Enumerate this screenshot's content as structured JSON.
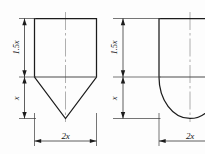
{
  "diagram": {
    "background_color": "#fdfdfd",
    "line_color": "#1c1c1c",
    "centerline_color": "#9a9a9a",
    "figures": [
      {
        "id": "conical-bottom-tank",
        "name": "Tank with conical bottom",
        "bottom_type": "cone",
        "dimensions": {
          "body_height": "1.5x",
          "bottom_height": "x",
          "width": "2x"
        }
      },
      {
        "id": "hemispherical-bottom-tank",
        "name": "Tank with hemispherical bottom",
        "bottom_type": "hemisphere",
        "dimensions": {
          "body_height": "1.5x",
          "bottom_height": "x",
          "width": "2x"
        }
      }
    ],
    "labels": {
      "left_body_height": "1.5x",
      "left_bottom_height": "x",
      "left_width": "2x",
      "right_body_height": "1.5x",
      "right_bottom_height": "x",
      "right_width": "2x"
    }
  }
}
